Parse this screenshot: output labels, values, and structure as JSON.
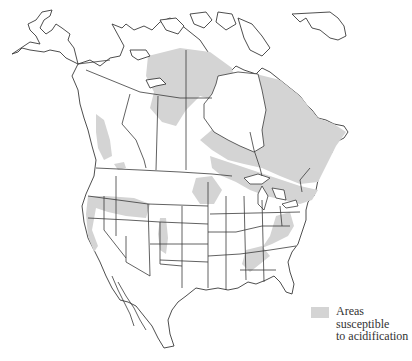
{
  "figure": {
    "type": "map",
    "region": "North America",
    "legend": {
      "swatch_color": "#d4d4d4",
      "label_line1": "Areas susceptible",
      "label_line2": "to acidification"
    },
    "colors": {
      "shaded_area": "#d4d4d4",
      "outline": "#3a3a3a",
      "background": "#ffffff"
    }
  }
}
